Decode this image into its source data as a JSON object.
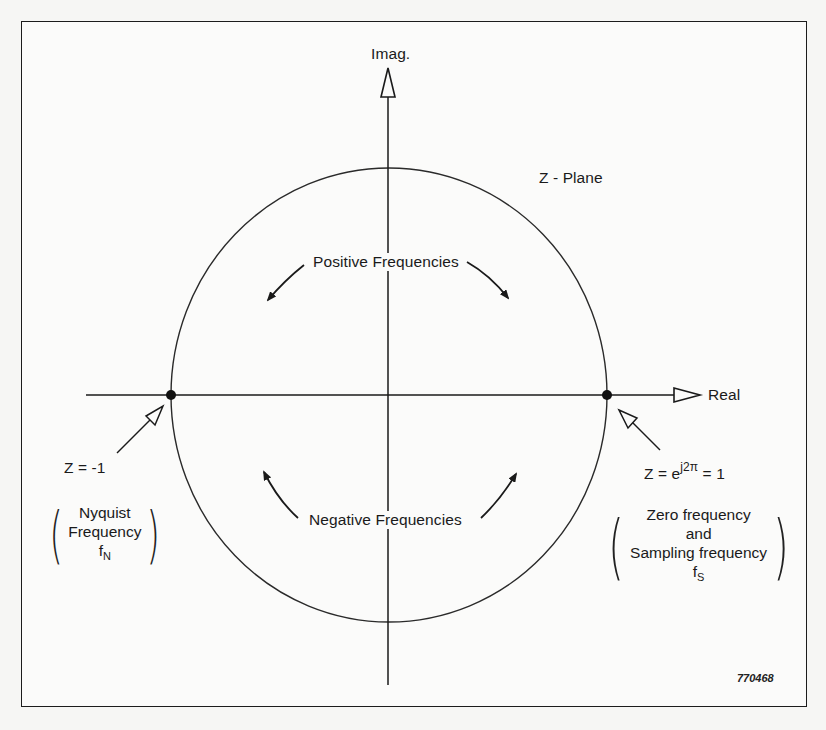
{
  "diagram": {
    "plane_title": "Z - Plane",
    "axes": {
      "imag_label": "Imag.",
      "real_label": "Real"
    },
    "arc_labels": {
      "positive": "Positive Frequencies",
      "negative": "Negative Frequencies"
    },
    "points": {
      "left": {
        "equation": "Z  = -1",
        "note_lines": [
          "Nyquist",
          "Frequency"
        ],
        "symbol_base": "f",
        "symbol_sub": "N"
      },
      "right": {
        "eq_prefix": "Z = e",
        "eq_exponent": "j2π",
        "eq_suffix": " = 1",
        "note_lines": [
          "Zero frequency",
          "and",
          "Sampling frequency"
        ],
        "symbol_base": "f",
        "symbol_sub": "S"
      }
    },
    "figure_id": "770468",
    "colors": {
      "ink": "#1a1a1a",
      "paper": "#fbfbfa"
    }
  }
}
